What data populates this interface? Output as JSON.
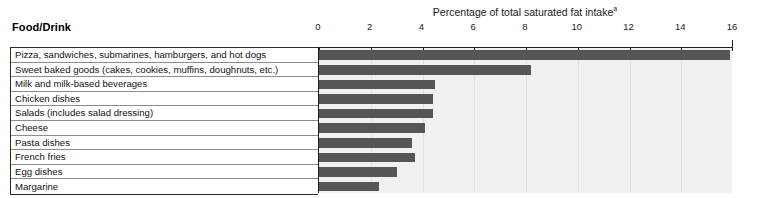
{
  "chart_data": {
    "type": "bar",
    "orientation": "horizontal",
    "title": "Percentage of total saturated fat intake",
    "title_superscript": "a",
    "xlabel": "Percentage of total saturated fat intake",
    "ylabel": "Food/Drink",
    "xlim": [
      0,
      16
    ],
    "xticks": [
      0,
      2,
      4,
      6,
      8,
      10,
      12,
      14,
      16
    ],
    "xtick_labels": [
      "0",
      "2",
      "4",
      "6",
      "8",
      "10",
      "12",
      "14",
      "16"
    ],
    "grid": true,
    "legend": "none",
    "categories": [
      "Pizza, sandwiches, submarines, hamburgers, and hot dogs",
      "Sweet baked goods (cakes, cookies, muffins, doughnuts, etc.)",
      "Milk and milk-based beverages",
      "Chicken dishes",
      "Salads (includes salad dressing)",
      "Cheese",
      "Pasta dishes",
      "French fries",
      "Egg dishes",
      "Margarine"
    ],
    "values": [
      15.9,
      8.2,
      4.5,
      4.4,
      4.4,
      4.1,
      3.6,
      3.7,
      3.0,
      2.3
    ],
    "bar_color": "#565656",
    "plot_background": "#f1f1f1"
  },
  "header": {
    "category_column": "Food/Drink",
    "axis_title_text": "Percentage of total saturated fat intake",
    "axis_title_superscript": "a"
  },
  "colors": {
    "bar": "#565656",
    "plot_bg": "#f1f1f1",
    "axis": "#1e1e1e",
    "row_rule": "#8d8d8d",
    "page_bg": "#ffffff"
  }
}
